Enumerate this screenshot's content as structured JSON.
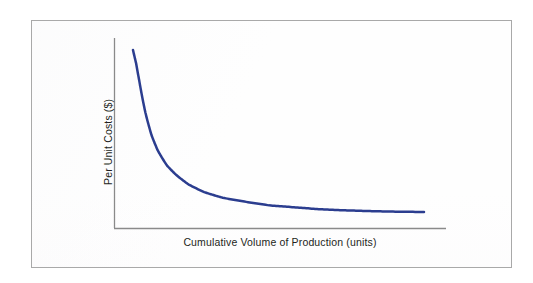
{
  "figure": {
    "background_color": "#ffffff",
    "frame_border_color": "#a9a9a9"
  },
  "chart_data": {
    "type": "line",
    "title": "",
    "subtitle": "",
    "xlabel": "Cumulative Volume of Production (units)",
    "ylabel": "Per Unit Costs ($)",
    "xlim": [
      0,
      100
    ],
    "ylim": [
      0,
      100
    ],
    "grid": false,
    "legend": false,
    "legend_position": "none",
    "axis_tick_labels": {
      "x": [],
      "y": []
    },
    "annotations": [],
    "series": [
      {
        "name": "Per unit cost",
        "color": "#2b3d8f",
        "line_width": 2.5,
        "x": [
          6,
          7,
          8,
          9,
          10,
          12,
          14,
          17,
          20,
          24,
          29,
          35,
          42,
          50,
          58,
          66,
          74,
          82,
          90,
          100
        ],
        "y": [
          95,
          88,
          79,
          70,
          62,
          50,
          42,
          34,
          29,
          24,
          20,
          17,
          15,
          13,
          12,
          11,
          10.4,
          10,
          9.7,
          9.5
        ]
      }
    ]
  }
}
